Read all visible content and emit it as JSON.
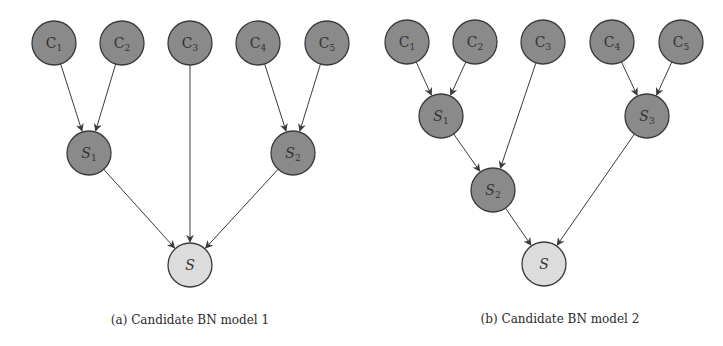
{
  "colors": {
    "dark_node": "#8a8a8a",
    "light_node": "#dcdcdc",
    "stroke": "#3a3a3a",
    "edge": "#3a3a3a"
  },
  "panels": [
    {
      "id": "a",
      "caption": "(a) Candidate BN model 1",
      "nodes": [
        {
          "id": "C1",
          "base": "C",
          "sub": "1",
          "x": 54,
          "y": 43,
          "type": "dark"
        },
        {
          "id": "C2",
          "base": "C",
          "sub": "2",
          "x": 122,
          "y": 43,
          "type": "dark"
        },
        {
          "id": "C3",
          "base": "C",
          "sub": "3",
          "x": 190,
          "y": 43,
          "type": "dark"
        },
        {
          "id": "C4",
          "base": "C",
          "sub": "4",
          "x": 258,
          "y": 43,
          "type": "dark"
        },
        {
          "id": "C5",
          "base": "C",
          "sub": "5",
          "x": 327,
          "y": 43,
          "type": "dark"
        },
        {
          "id": "S1",
          "base": "S",
          "sub": "1",
          "x": 89,
          "y": 153,
          "type": "dark"
        },
        {
          "id": "S2",
          "base": "S",
          "sub": "2",
          "x": 293,
          "y": 153,
          "type": "dark"
        },
        {
          "id": "S",
          "base": "S",
          "sub": "",
          "x": 190,
          "y": 265,
          "type": "light"
        }
      ],
      "edges": [
        [
          "C1",
          "S1"
        ],
        [
          "C2",
          "S1"
        ],
        [
          "C4",
          "S2"
        ],
        [
          "C5",
          "S2"
        ],
        [
          "S1",
          "S"
        ],
        [
          "C3",
          "S"
        ],
        [
          "S2",
          "S"
        ]
      ]
    },
    {
      "id": "b",
      "caption": "(b) Candidate BN model 2",
      "nodes": [
        {
          "id": "C1",
          "base": "C",
          "sub": "1",
          "x": 407,
          "y": 42,
          "type": "dark"
        },
        {
          "id": "C2",
          "base": "C",
          "sub": "2",
          "x": 475,
          "y": 42,
          "type": "dark"
        },
        {
          "id": "C3",
          "base": "C",
          "sub": "3",
          "x": 543,
          "y": 42,
          "type": "dark"
        },
        {
          "id": "C4",
          "base": "C",
          "sub": "4",
          "x": 612,
          "y": 42,
          "type": "dark"
        },
        {
          "id": "C5",
          "base": "C",
          "sub": "5",
          "x": 681,
          "y": 42,
          "type": "dark"
        },
        {
          "id": "S1",
          "base": "S",
          "sub": "1",
          "x": 441,
          "y": 116,
          "type": "dark"
        },
        {
          "id": "S3",
          "base": "S",
          "sub": "3",
          "x": 647,
          "y": 116,
          "type": "dark"
        },
        {
          "id": "S2",
          "base": "S",
          "sub": "2",
          "x": 493,
          "y": 190,
          "type": "dark"
        },
        {
          "id": "S",
          "base": "S",
          "sub": "",
          "x": 544,
          "y": 264,
          "type": "light"
        }
      ],
      "edges": [
        [
          "C1",
          "S1"
        ],
        [
          "C2",
          "S1"
        ],
        [
          "C4",
          "S3"
        ],
        [
          "C5",
          "S3"
        ],
        [
          "S1",
          "S2"
        ],
        [
          "C3",
          "S2"
        ],
        [
          "S2",
          "S"
        ],
        [
          "S3",
          "S"
        ]
      ]
    }
  ],
  "node_radius": 22
}
